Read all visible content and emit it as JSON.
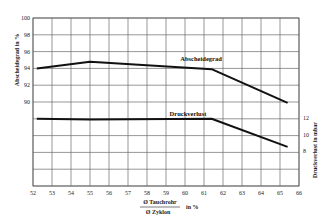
{
  "chart_data": {
    "type": "line",
    "title": "",
    "xlabel_numerator": "Ø Tauchrohr",
    "xlabel_denominator": "Ø Zyklon",
    "xlabel_unit": "in %",
    "ylabel_left": "Abscheidegrad in %",
    "ylabel_right": "Druckverlust in mbar",
    "xlim": [
      52,
      66
    ],
    "ylim_left": [
      84,
      100
    ],
    "x_ticks": [
      "52",
      "53",
      "54",
      "55",
      "56",
      "57",
      "58",
      "59",
      "60",
      "61",
      "62",
      "63",
      "64",
      "65",
      "66"
    ],
    "y_ticks_left": [
      "100",
      "98",
      "96",
      "94",
      "92",
      "90"
    ],
    "y_ticks_right": [
      "12",
      "10",
      "8"
    ],
    "grid": true,
    "series": [
      {
        "name": "Abscheidegrad",
        "axis": "left",
        "x": [
          52.2,
          55.0,
          61.4,
          65.4
        ],
        "values": [
          94.0,
          94.8,
          93.9,
          89.9
        ]
      },
      {
        "name": "Druckverlust",
        "axis": "right",
        "x": [
          52.2,
          55.0,
          61.4,
          65.4
        ],
        "values": [
          11.9,
          11.8,
          11.9,
          8.5
        ]
      }
    ]
  }
}
